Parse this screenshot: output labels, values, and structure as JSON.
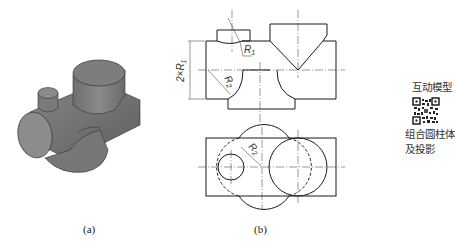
{
  "figure": {
    "captions": {
      "a": "(a)",
      "b": "(b)"
    },
    "iso_view": {
      "description": "isometric rendering of combined cylinders"
    },
    "front_view": {
      "dimensions": {
        "diameter": "2×R",
        "diameter_sub": "1",
        "r1": "R",
        "r1_sub": "1",
        "r2": "R",
        "r2_sub": "2"
      }
    },
    "top_view": {
      "dimensions": {
        "r2": "R",
        "r2_sub": "2"
      }
    }
  },
  "sidebar": {
    "title": "互动模型",
    "qr_code": "qr-code",
    "subtitle_line1": "组合圆柱体",
    "subtitle_line2": "及投影"
  },
  "colors": {
    "line": "#1a1a1a",
    "shade": "#7a7a7a",
    "bg": "#ffffff"
  }
}
